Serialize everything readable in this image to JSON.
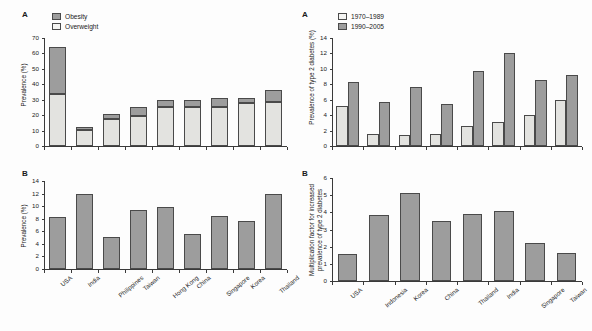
{
  "figure": {
    "panels": [
      "A",
      "B",
      "A",
      "B"
    ]
  },
  "panel_left_a": {
    "letter": "A",
    "ylabel": "Prevalence (%)",
    "legend": [
      {
        "label": "Obesity",
        "swatch": "dark"
      },
      {
        "label": "Overweight",
        "swatch": "light"
      }
    ]
  },
  "panel_left_b": {
    "letter": "B",
    "ylabel": "Prevalence (%)"
  },
  "panel_right_a": {
    "letter": "A",
    "ylabel": "Prevalence of type 2 diabetes (%)",
    "legend": [
      {
        "label": "1970–1989",
        "swatch": "light"
      },
      {
        "label": "1990–2005",
        "swatch": "dark"
      }
    ]
  },
  "panel_right_b": {
    "letter": "B",
    "ylabel_line1": "Multiplication factor for increased",
    "ylabel_line2": "prevalence of type 2 diabetes"
  },
  "chart_data": [
    {
      "id": "left-a",
      "type": "bar",
      "stacked": true,
      "title": "",
      "xlabel": "",
      "ylabel": "Prevalence (%)",
      "ylim": [
        0,
        70
      ],
      "yticks": [
        0,
        10,
        20,
        30,
        40,
        50,
        60,
        70
      ],
      "grid": false,
      "legend_position": "top-left",
      "categories": [
        "USA",
        "India",
        "Philippines",
        "Taiwan",
        "Hong Kong",
        "China",
        "Singapore",
        "Korea",
        "Thailand"
      ],
      "series": [
        {
          "name": "Overweight",
          "color": "#e3e3e0",
          "values": [
            34.0,
            10.5,
            17.5,
            19.5,
            25.0,
            25.0,
            25.0,
            28.0,
            28.5
          ]
        },
        {
          "name": "Obesity",
          "color": "#9d9d9d",
          "values": [
            30.0,
            2.0,
            3.0,
            5.5,
            4.5,
            4.5,
            6.0,
            3.0,
            7.5
          ]
        }
      ],
      "totals": [
        64.0,
        12.5,
        20.5,
        25.0,
        29.5,
        29.5,
        31.0,
        31.0,
        36.0
      ]
    },
    {
      "id": "left-b",
      "type": "bar",
      "stacked": false,
      "title": "",
      "xlabel": "",
      "ylabel": "Prevalence (%)",
      "ylim": [
        0,
        14
      ],
      "yticks": [
        0,
        2,
        4,
        6,
        8,
        10,
        12,
        14
      ],
      "grid": false,
      "categories": [
        "USA",
        "India",
        "Philippines",
        "Taiwan",
        "Hong Kong",
        "China",
        "Singapore",
        "Korea",
        "Thailand"
      ],
      "series": [
        {
          "name": "Prevalence",
          "color": "#9d9d9d",
          "values": [
            8.3,
            12.0,
            5.1,
            9.4,
            9.9,
            5.6,
            8.4,
            7.6,
            12.0
          ]
        }
      ]
    },
    {
      "id": "right-a",
      "type": "bar",
      "stacked": false,
      "title": "",
      "xlabel": "",
      "ylabel": "Prevalence of type 2 diabetes (%)",
      "ylim": [
        0,
        14
      ],
      "yticks": [
        0,
        2,
        4,
        6,
        8,
        10,
        12,
        14
      ],
      "grid": false,
      "legend_position": "top-left",
      "categories": [
        "USA",
        "Indonesia",
        "Korea",
        "China",
        "Thailand",
        "India",
        "Singapore",
        "Taiwan"
      ],
      "series": [
        {
          "name": "1970–1989",
          "color": "#e3e3e0",
          "values": [
            5.2,
            1.5,
            1.4,
            1.6,
            2.6,
            3.1,
            4.0,
            5.9
          ]
        },
        {
          "name": "1990–2005",
          "color": "#9d9d9d",
          "values": [
            8.3,
            5.7,
            7.6,
            5.5,
            9.7,
            12.1,
            8.5,
            9.2
          ]
        }
      ]
    },
    {
      "id": "right-b",
      "type": "bar",
      "stacked": false,
      "title": "",
      "xlabel": "",
      "ylabel": "Multiplication factor for increased prevalence of type 2 diabetes",
      "ylim": [
        0,
        6
      ],
      "yticks": [
        0,
        1,
        2,
        3,
        4,
        5,
        6
      ],
      "grid": false,
      "categories": [
        "USA",
        "Indonesia",
        "Korea",
        "China",
        "Thailand",
        "India",
        "Singapore",
        "Taiwan"
      ],
      "series": [
        {
          "name": "Multiplication factor",
          "color": "#9d9d9d",
          "values": [
            1.6,
            3.85,
            5.1,
            3.5,
            3.9,
            4.1,
            2.2,
            1.65
          ]
        }
      ]
    }
  ]
}
